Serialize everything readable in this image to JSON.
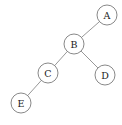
{
  "diagram": {
    "background_color": "#ffffff",
    "node_fill_color": "#ffffff",
    "node_stroke_color": "#7a7a7a",
    "edge_color": "#8c8c8c",
    "label_color": "#1a1a1a",
    "node_radius": 10,
    "nodes": [
      {
        "id": "A",
        "label": "A",
        "cx": 107,
        "cy": 15,
        "r": 10
      },
      {
        "id": "B",
        "label": "B",
        "cx": 74,
        "cy": 44,
        "r": 10
      },
      {
        "id": "C",
        "label": "C",
        "cx": 48,
        "cy": 73,
        "r": 10
      },
      {
        "id": "D",
        "label": "D",
        "cx": 105,
        "cy": 75,
        "r": 10
      },
      {
        "id": "E",
        "label": "E",
        "cx": 21,
        "cy": 103,
        "r": 10
      }
    ],
    "edges": [
      {
        "id": "edge-b-a",
        "from": "B",
        "to": "A",
        "x1": 81.3,
        "y1": 37.2,
        "x2": 99.7,
        "y2": 21.8
      },
      {
        "id": "edge-b-c",
        "from": "B",
        "to": "C",
        "x1": 66.6,
        "y1": 51.3,
        "x2": 55.4,
        "y2": 65.7
      },
      {
        "id": "edge-b-d",
        "from": "B",
        "to": "D",
        "x1": 82.3,
        "y1": 50.8,
        "x2": 96.7,
        "y2": 68.2
      },
      {
        "id": "edge-c-e",
        "from": "C",
        "to": "E",
        "x1": 40.2,
        "y1": 78.8,
        "x2": 28.8,
        "y2": 97.2
      }
    ]
  }
}
